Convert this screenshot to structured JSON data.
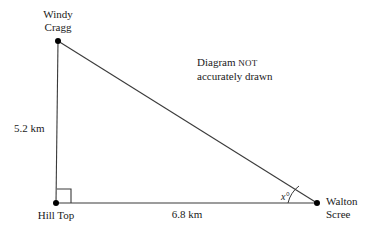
{
  "diagram": {
    "type": "right-triangle",
    "note": {
      "line1_prefix": "Diagram ",
      "line1_emphasis": "NOT",
      "line2": "accurately drawn"
    },
    "vertices": [
      {
        "id": "windy-cragg",
        "label_line1": "Windy",
        "label_line2": "Cragg",
        "x": 58,
        "y": 41
      },
      {
        "id": "hill-top",
        "label_line1": "Hill Top",
        "label_line2": "",
        "x": 56,
        "y": 203
      },
      {
        "id": "walton-scree",
        "label_line1": "Walton",
        "label_line2": "Scree",
        "x": 317,
        "y": 203
      }
    ],
    "sides": [
      {
        "id": "vertical-side",
        "label": "5.2 km",
        "from": "hill-top",
        "to": "windy-cragg"
      },
      {
        "id": "horizontal-side",
        "label": "6.8 km",
        "from": "hill-top",
        "to": "walton-scree"
      },
      {
        "id": "hypotenuse",
        "label": "",
        "from": "windy-cragg",
        "to": "walton-scree"
      }
    ],
    "angles": [
      {
        "id": "right-angle",
        "at": "hill-top",
        "label": "",
        "marker": "square"
      },
      {
        "id": "unknown-angle",
        "at": "walton-scree",
        "label": "x°",
        "marker": "arc"
      }
    ],
    "colors": {
      "stroke": "#3a3a3a",
      "text": "#1a1a1a",
      "background": "#ffffff",
      "vertex_dot": "#000000"
    }
  }
}
